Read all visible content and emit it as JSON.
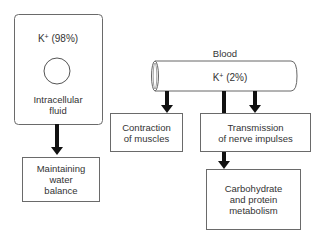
{
  "intracellular": {
    "ion_label": "K",
    "ion_charge": "+",
    "percent_label": "(98%)",
    "compartment_label_line1": "Intracellular",
    "compartment_label_line2": "fluid"
  },
  "blood": {
    "title": "Blood",
    "ion_label": "K",
    "ion_charge": "+",
    "percent_label": "(2%)"
  },
  "functions": {
    "water_balance": [
      "Maintaining",
      "water",
      "balance"
    ],
    "muscle_contraction": [
      "Contraction",
      "of muscles"
    ],
    "nerve_transmission": [
      "Transmission",
      "of nerve impulses"
    ],
    "metabolism": [
      "Carbohydrate",
      "and protein",
      "metabolism"
    ]
  }
}
